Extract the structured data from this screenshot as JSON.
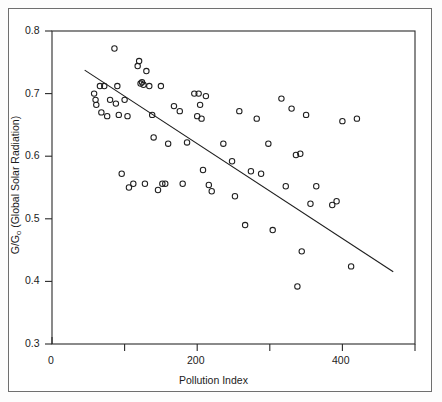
{
  "chart_data": {
    "type": "scatter",
    "title": "",
    "xlabel": "Pollution Index",
    "ylabel_prefix": "G/G",
    "ylabel_subscript": "o",
    "ylabel_suffix": " (Global Solar Radiation)",
    "ylabel": "G/Go  (Global Solar Radiation)",
    "xlim": [
      0,
      500
    ],
    "ylim": [
      0.3,
      0.8
    ],
    "grid": false,
    "legend": null,
    "xticks": [
      0,
      100,
      200,
      300,
      400,
      500
    ],
    "xtick_labels": [
      "0",
      "",
      "200",
      "",
      "400",
      ""
    ],
    "yticks": [
      0.3,
      0.4,
      0.5,
      0.6,
      0.7,
      0.8
    ],
    "ytick_labels": [
      "0.3",
      "0.4",
      "0.5",
      "0.6",
      "0.7",
      "0.8"
    ],
    "marker": "open-circle",
    "marker_color": "#1f1f1f",
    "line_color": "#1f1f1f",
    "points": [
      [
        58,
        0.7
      ],
      [
        60,
        0.69
      ],
      [
        61,
        0.682
      ],
      [
        66,
        0.712
      ],
      [
        68,
        0.67
      ],
      [
        72,
        0.712
      ],
      [
        76,
        0.664
      ],
      [
        80,
        0.69
      ],
      [
        86,
        0.772
      ],
      [
        88,
        0.684
      ],
      [
        90,
        0.712
      ],
      [
        92,
        0.666
      ],
      [
        96,
        0.572
      ],
      [
        100,
        0.69
      ],
      [
        104,
        0.664
      ],
      [
        106,
        0.55
      ],
      [
        112,
        0.556
      ],
      [
        118,
        0.744
      ],
      [
        120,
        0.752
      ],
      [
        122,
        0.716
      ],
      [
        124,
        0.718
      ],
      [
        126,
        0.714
      ],
      [
        128,
        0.556
      ],
      [
        130,
        0.736
      ],
      [
        134,
        0.712
      ],
      [
        138,
        0.666
      ],
      [
        140,
        0.63
      ],
      [
        146,
        0.546
      ],
      [
        150,
        0.712
      ],
      [
        152,
        0.556
      ],
      [
        156,
        0.556
      ],
      [
        160,
        0.62
      ],
      [
        168,
        0.68
      ],
      [
        176,
        0.672
      ],
      [
        180,
        0.556
      ],
      [
        186,
        0.622
      ],
      [
        196,
        0.7
      ],
      [
        200,
        0.664
      ],
      [
        202,
        0.7
      ],
      [
        204,
        0.682
      ],
      [
        206,
        0.66
      ],
      [
        208,
        0.578
      ],
      [
        212,
        0.696
      ],
      [
        216,
        0.554
      ],
      [
        220,
        0.544
      ],
      [
        236,
        0.62
      ],
      [
        248,
        0.592
      ],
      [
        252,
        0.536
      ],
      [
        258,
        0.672
      ],
      [
        266,
        0.49
      ],
      [
        274,
        0.576
      ],
      [
        282,
        0.66
      ],
      [
        288,
        0.572
      ],
      [
        298,
        0.62
      ],
      [
        304,
        0.482
      ],
      [
        316,
        0.692
      ],
      [
        322,
        0.552
      ],
      [
        330,
        0.676
      ],
      [
        336,
        0.602
      ],
      [
        338,
        0.392
      ],
      [
        342,
        0.604
      ],
      [
        344,
        0.448
      ],
      [
        350,
        0.666
      ],
      [
        356,
        0.524
      ],
      [
        364,
        0.552
      ],
      [
        386,
        0.522
      ],
      [
        392,
        0.528
      ],
      [
        400,
        0.656
      ],
      [
        412,
        0.424
      ],
      [
        420,
        0.66
      ]
    ],
    "trend_line": {
      "x_start": 45,
      "y_start": 0.7375,
      "x_end": 470,
      "y_end": 0.4155,
      "description": "linear regression fit, negative slope"
    }
  }
}
